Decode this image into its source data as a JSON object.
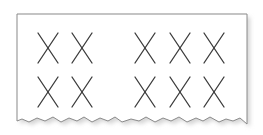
{
  "figure": {
    "mark_glyph": "X",
    "rows": [
      {
        "groups": [
          {
            "count": 2
          },
          {
            "count": 3
          }
        ]
      },
      {
        "groups": [
          {
            "count": 2
          },
          {
            "count": 3
          }
        ]
      }
    ],
    "total_marks": 10,
    "colors": {
      "paper": "#ffffff",
      "border": "#8a8a8a",
      "mark": "#3a3a3a",
      "shadow": "#d4d4d4"
    }
  }
}
